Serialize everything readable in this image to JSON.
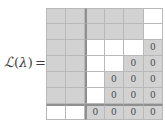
{
  "label": {
    "script_l": "ℒ",
    "open_paren": "(",
    "lambda": "λ",
    "close_paren": ")",
    "equals": "="
  },
  "colors": {
    "cell_gray": "#d2d2d2",
    "cell_white": "#ffffff",
    "thin_rule": "#b9b9b9",
    "thick_rule": "#8f8f8f",
    "text": "#4a4a4a"
  },
  "matrix": {
    "rows": 7,
    "cols": 6,
    "zero_glyph": "0",
    "block_separator_after_col": 2,
    "block_separator_before_row": 6,
    "cells": [
      [
        {
          "fill": "gray",
          "text": ""
        },
        {
          "fill": "gray",
          "text": ""
        },
        {
          "fill": "gray",
          "text": ""
        },
        {
          "fill": "gray",
          "text": ""
        },
        {
          "fill": "gray",
          "text": ""
        },
        {
          "fill": "white",
          "text": ""
        }
      ],
      [
        {
          "fill": "gray",
          "text": ""
        },
        {
          "fill": "gray",
          "text": ""
        },
        {
          "fill": "gray",
          "text": ""
        },
        {
          "fill": "gray",
          "text": ""
        },
        {
          "fill": "gray",
          "text": ""
        },
        {
          "fill": "white",
          "text": ""
        }
      ],
      [
        {
          "fill": "gray",
          "text": ""
        },
        {
          "fill": "gray",
          "text": ""
        },
        {
          "fill": "white",
          "text": ""
        },
        {
          "fill": "white",
          "text": ""
        },
        {
          "fill": "white",
          "text": ""
        },
        {
          "fill": "gray",
          "text": "0"
        }
      ],
      [
        {
          "fill": "gray",
          "text": ""
        },
        {
          "fill": "gray",
          "text": ""
        },
        {
          "fill": "white",
          "text": ""
        },
        {
          "fill": "white",
          "text": ""
        },
        {
          "fill": "gray",
          "text": "0"
        },
        {
          "fill": "gray",
          "text": "0"
        }
      ],
      [
        {
          "fill": "gray",
          "text": ""
        },
        {
          "fill": "gray",
          "text": ""
        },
        {
          "fill": "white",
          "text": ""
        },
        {
          "fill": "gray",
          "text": "0"
        },
        {
          "fill": "gray",
          "text": "0"
        },
        {
          "fill": "gray",
          "text": "0"
        }
      ],
      [
        {
          "fill": "gray",
          "text": ""
        },
        {
          "fill": "gray",
          "text": ""
        },
        {
          "fill": "white",
          "text": ""
        },
        {
          "fill": "gray",
          "text": "0"
        },
        {
          "fill": "gray",
          "text": "0"
        },
        {
          "fill": "gray",
          "text": "0"
        }
      ],
      [
        {
          "fill": "white",
          "text": ""
        },
        {
          "fill": "white",
          "text": ""
        },
        {
          "fill": "gray",
          "text": "0"
        },
        {
          "fill": "gray",
          "text": "0"
        },
        {
          "fill": "gray",
          "text": "0"
        },
        {
          "fill": "gray",
          "text": "0"
        }
      ]
    ]
  }
}
